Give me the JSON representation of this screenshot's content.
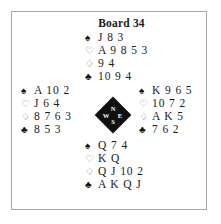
{
  "board": {
    "title": "Board 34"
  },
  "suit_symbols": {
    "spade": "♠",
    "heart": "♡",
    "diamond": "♢",
    "club": "♣"
  },
  "compass": {
    "north": "N",
    "west": "W",
    "east": "E",
    "south": "S"
  },
  "hands": {
    "north": {
      "seat": "North",
      "spades": "J 8 3",
      "hearts": "A 9 8 5 3",
      "diamonds": "9 4",
      "clubs": "10 9 4"
    },
    "west": {
      "seat": "West",
      "spades": "A 10 2",
      "hearts": "J 6 4",
      "diamonds": "8 7 6 3",
      "clubs": "8 5 3"
    },
    "east": {
      "seat": "East",
      "spades": "K 9 6 5",
      "hearts": "10 7 2",
      "diamonds": "A K 5",
      "clubs": "7 6 2"
    },
    "south": {
      "seat": "South",
      "spades": "Q 7 4",
      "hearts": "K Q",
      "diamonds": "Q J 10 2",
      "clubs": "A K Q J"
    }
  },
  "colors": {
    "frame": "#a8a8a8",
    "compass_fill": "#101010",
    "text": "#1a1a1a",
    "background": "#ffffff"
  }
}
